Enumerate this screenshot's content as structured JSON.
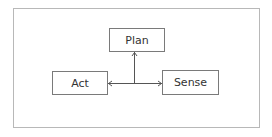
{
  "diagram": {
    "nodes": [
      {
        "id": "plan",
        "label": "Plan"
      },
      {
        "id": "act",
        "label": "Act"
      },
      {
        "id": "sense",
        "label": "Sense"
      }
    ],
    "edges": [
      {
        "from": "plan",
        "to": "junction",
        "type": "bidirectional"
      },
      {
        "from": "act",
        "to": "junction",
        "type": "bidirectional"
      },
      {
        "from": "sense",
        "to": "junction",
        "type": "bidirectional"
      }
    ],
    "colors": {
      "node_border": "#7a7a7a",
      "frame_border": "#b8b8b8",
      "text": "#333333",
      "line": "#555555"
    }
  }
}
